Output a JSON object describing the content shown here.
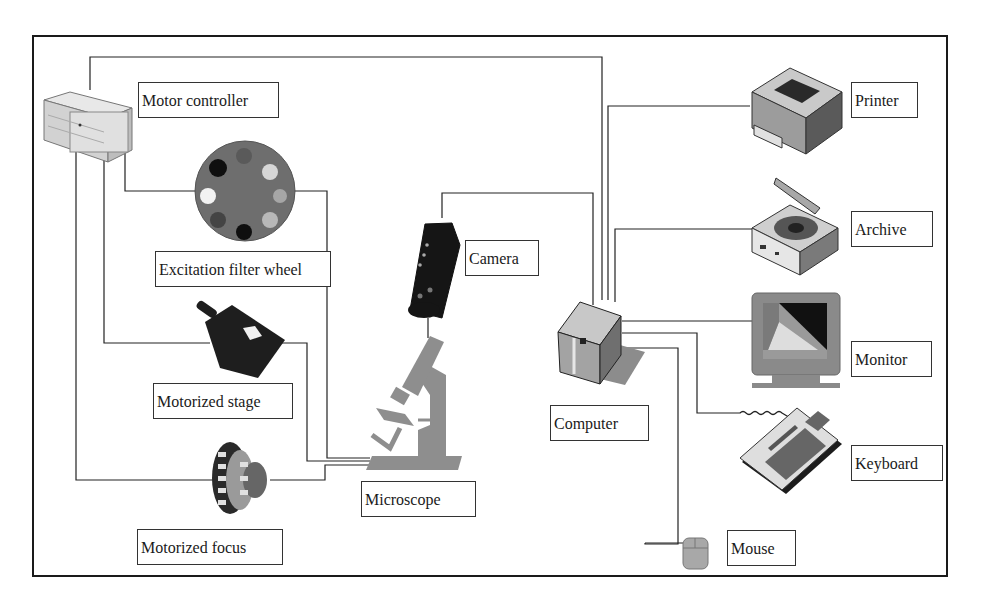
{
  "diagram": {
    "components": {
      "motor_controller": "Motor controller",
      "filter_wheel": "Excitation filter wheel",
      "camera": "Camera",
      "stage": "Motorized stage",
      "microscope": "Microscope",
      "focus": "Motorized focus",
      "computer": "Computer",
      "printer": "Printer",
      "archive": "Archive",
      "monitor": "Monitor",
      "keyboard": "Keyboard",
      "mouse": "Mouse"
    },
    "connections": [
      [
        "Motor controller",
        "Computer"
      ],
      [
        "Motor controller",
        "Excitation filter wheel"
      ],
      [
        "Motor controller",
        "Motorized stage"
      ],
      [
        "Motor controller",
        "Motorized focus"
      ],
      [
        "Excitation filter wheel",
        "Microscope"
      ],
      [
        "Motorized stage",
        "Microscope"
      ],
      [
        "Motorized focus",
        "Microscope"
      ],
      [
        "Camera",
        "Microscope"
      ],
      [
        "Camera",
        "Computer"
      ],
      [
        "Computer",
        "Printer"
      ],
      [
        "Computer",
        "Archive"
      ],
      [
        "Computer",
        "Monitor"
      ],
      [
        "Computer",
        "Keyboard"
      ],
      [
        "Computer",
        "Mouse"
      ]
    ],
    "colors": {
      "frame": "#1a1a1a",
      "wire": "#222222",
      "device_dark": "#1e1e1e",
      "device_gray": "#8a8a8a",
      "device_light": "#d8d8d8"
    }
  }
}
